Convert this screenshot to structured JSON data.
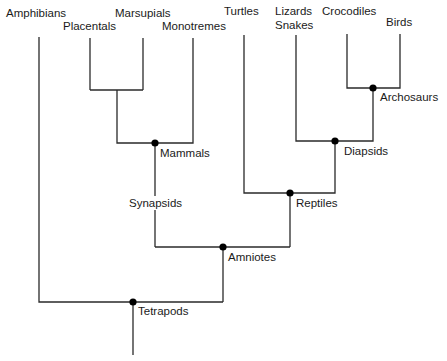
{
  "diagram": {
    "type": "phylogenetic-tree",
    "colors": {
      "line": "#2a2a2a",
      "node": "#000000",
      "text": "#1a1a1a",
      "background": "#ffffff"
    },
    "taxa": {
      "amphibians": "Amphibians",
      "placentals": "Placentals",
      "marsupials": "Marsupials",
      "monotremes": "Monotremes",
      "turtles": "Turtles",
      "lizards": "Lizards",
      "snakes": "Snakes",
      "crocodiles": "Crocodiles",
      "birds": "Birds"
    },
    "clades": {
      "archosaurs": "Archosaurs",
      "mammals": "Mammals",
      "diapsids": "Diapsids",
      "synapsids": "Synapsids",
      "reptiles": "Reptiles",
      "amniotes": "Amniotes",
      "tetrapods": "Tetrapods"
    }
  }
}
